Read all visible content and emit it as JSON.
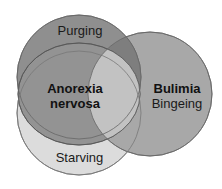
{
  "diagram": {
    "type": "venn",
    "sets": [
      {
        "id": "purging",
        "label": "Purging",
        "fill": "#8e8e8e"
      },
      {
        "id": "anorexia",
        "label_line1": "Anorexia",
        "label_line2": "nervosa",
        "fill": "#9a9a9a"
      },
      {
        "id": "starving",
        "label": "Starving",
        "fill": "#d8d8d8"
      },
      {
        "id": "bulimia",
        "label_line1": "Bulimia",
        "label_line2": "Bingeing",
        "fill": "#a6a6a6"
      }
    ],
    "overlap_fill": "#c4c4c4",
    "stroke": "#555555"
  }
}
